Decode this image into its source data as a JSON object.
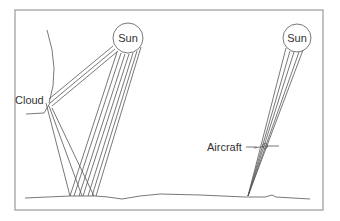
{
  "diagram": {
    "type": "illustration",
    "labels": {
      "sun_left": "Sun",
      "sun_right": "Sun",
      "cloud": "Cloud",
      "aircraft": "Aircraft"
    },
    "colors": {
      "line": "#555555",
      "frame": "#9a9a9a",
      "background": "#ffffff"
    }
  }
}
